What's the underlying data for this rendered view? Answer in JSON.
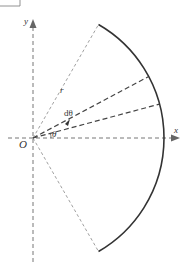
{
  "diagram": {
    "labels": {
      "x_axis": "x",
      "y_axis": "y",
      "origin": "O",
      "radius": "r",
      "differential_angle": "dθ",
      "angle": "θ"
    },
    "sector_half_angle_deg": 60,
    "ray_angles_deg": {
      "theta": 15,
      "theta_plus_dtheta": 28
    },
    "colors": {
      "arc": "#333333",
      "dashed": "#555555",
      "axis": "#666666"
    }
  }
}
